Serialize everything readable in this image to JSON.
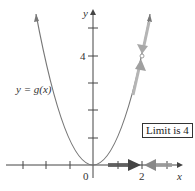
{
  "figure": {
    "function_label": "y = g(x)",
    "y_axis_label": "y",
    "x_axis_label": "x",
    "y_tick_label": "4",
    "x_tick_labels": {
      "origin": "0",
      "two": "2"
    },
    "limit_label": "Limit is 4",
    "curve": "parabola y = x^2",
    "approach_point": {
      "x": 2,
      "y": 4
    },
    "colors": {
      "axis": "#444444",
      "curve": "#777777",
      "arrow_dark": "#555555",
      "arrow_light": "#a8a8a8",
      "label": "#333333"
    }
  }
}
